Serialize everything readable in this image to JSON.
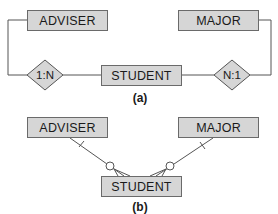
{
  "diagram_a": {
    "caption": "(a)",
    "entities": {
      "adviser": "ADVISER",
      "major": "MAJOR",
      "student": "STUDENT"
    },
    "relationships": {
      "adviser_student": "1:N",
      "student_major": "N:1"
    }
  },
  "diagram_b": {
    "caption": "(b)",
    "entities": {
      "adviser": "ADVISER",
      "major": "MAJOR",
      "student": "STUDENT"
    },
    "notation": "crow's foot (optional-many on STUDENT side, mandatory-one bar on parent side)"
  },
  "colors": {
    "entity_fill": "#d6d6d6",
    "diamond_fill": "#d6d6d6",
    "line": "#555555"
  }
}
